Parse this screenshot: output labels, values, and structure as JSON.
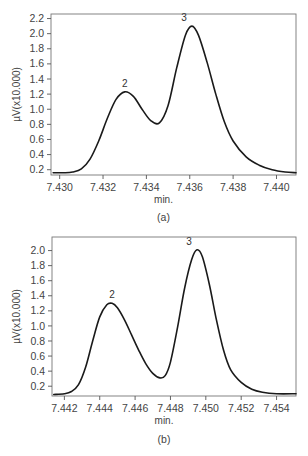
{
  "chart_data": [
    {
      "type": "line",
      "panel": "(a)",
      "title": "",
      "xlabel": "min.",
      "ylabel": "µV(x10.000)",
      "caption": "(a)",
      "xlim": [
        7.4296,
        7.4409
      ],
      "ylim": [
        0.13,
        2.26
      ],
      "xticks": [
        "7.430",
        "7.432",
        "7.434",
        "7.436",
        "7.438",
        "7.440"
      ],
      "xtick_values": [
        7.43,
        7.432,
        7.434,
        7.436,
        7.438,
        7.44
      ],
      "yticks": [
        "2.2",
        "2.0",
        "1.8",
        "1.6",
        "1.4",
        "1.2",
        "1.0",
        "0.8",
        "0.6",
        "0.4",
        "0.2"
      ],
      "ytick_values": [
        2.2,
        2.0,
        1.8,
        1.6,
        1.4,
        1.2,
        1.0,
        0.8,
        0.6,
        0.4,
        0.2
      ],
      "grid": false,
      "annotations": [
        {
          "text": "2",
          "x": 7.433,
          "y": 1.23
        },
        {
          "text": "3",
          "x": 7.4361,
          "y": 2.1
        }
      ],
      "series": [
        {
          "name": "signal",
          "x": [
            7.4297,
            7.4302,
            7.4306,
            7.431,
            7.4314,
            7.4318,
            7.4322,
            7.4326,
            7.433,
            7.4334,
            7.4338,
            7.4342,
            7.4346,
            7.435,
            7.4354,
            7.4358,
            7.4361,
            7.4364,
            7.4368,
            7.4372,
            7.4376,
            7.438,
            7.4386,
            7.4392,
            7.4398,
            7.4404,
            7.4409
          ],
          "values": [
            0.16,
            0.16,
            0.17,
            0.21,
            0.34,
            0.58,
            0.88,
            1.13,
            1.23,
            1.17,
            1.0,
            0.85,
            0.82,
            1.05,
            1.55,
            1.98,
            2.1,
            1.98,
            1.62,
            1.2,
            0.83,
            0.58,
            0.37,
            0.26,
            0.2,
            0.17,
            0.16
          ]
        }
      ]
    },
    {
      "type": "line",
      "panel": "(b)",
      "title": "",
      "xlabel": "min.",
      "ylabel": "µV(x10.000)",
      "caption": "(b)",
      "xlim": [
        7.4413,
        7.4551
      ],
      "ylim": [
        0.07,
        2.18
      ],
      "xticks": [
        "7.442",
        "7.444",
        "7.446",
        "7.448",
        "7.450",
        "7.452",
        "7.454"
      ],
      "xtick_values": [
        7.442,
        7.444,
        7.446,
        7.448,
        7.45,
        7.452,
        7.454
      ],
      "yticks": [
        "2.0",
        "1.8",
        "1.6",
        "1.4",
        "1.2",
        "1.0",
        "0.8",
        "0.6",
        "0.4",
        "0.2"
      ],
      "ytick_values": [
        2.0,
        1.8,
        1.6,
        1.4,
        1.2,
        1.0,
        0.8,
        0.6,
        0.4,
        0.2
      ],
      "grid": false,
      "annotations": [
        {
          "text": "2",
          "x": 7.4447,
          "y": 1.3
        },
        {
          "text": "3",
          "x": 7.4495,
          "y": 2.01
        }
      ],
      "series": [
        {
          "name": "signal",
          "x": [
            7.4414,
            7.442,
            7.4424,
            7.4428,
            7.4432,
            7.4436,
            7.444,
            7.4444,
            7.4447,
            7.445,
            7.4454,
            7.4458,
            7.4462,
            7.4466,
            7.447,
            7.4474,
            7.4477,
            7.448,
            7.4484,
            7.4488,
            7.4492,
            7.4495,
            7.4498,
            7.4502,
            7.4506,
            7.451,
            7.4514,
            7.452,
            7.4526,
            7.4532,
            7.454,
            7.4551
          ],
          "values": [
            0.09,
            0.1,
            0.13,
            0.22,
            0.45,
            0.8,
            1.12,
            1.28,
            1.3,
            1.24,
            1.08,
            0.88,
            0.68,
            0.5,
            0.37,
            0.31,
            0.34,
            0.52,
            0.98,
            1.5,
            1.88,
            2.01,
            1.92,
            1.55,
            1.08,
            0.68,
            0.42,
            0.25,
            0.16,
            0.12,
            0.1,
            0.1
          ]
        }
      ]
    }
  ]
}
